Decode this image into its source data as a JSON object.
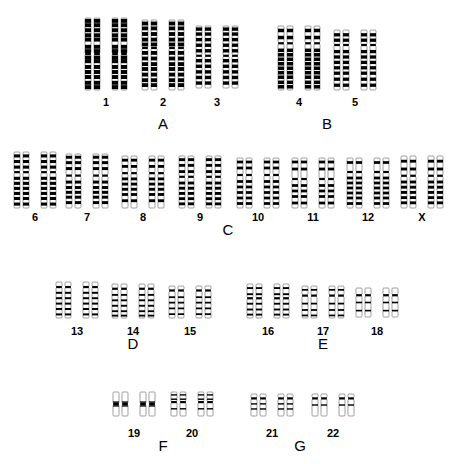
{
  "figure": {
    "kind": "human-karyotype",
    "background_color": "#ffffff",
    "ink_color": "#000000",
    "outline_color": "#777777",
    "total_chromosome_pairs": 23,
    "row_count": 5
  },
  "groups": [
    {
      "name": "A",
      "label": "A",
      "label_x": 163,
      "label_y": 115,
      "row": 1,
      "pairs": [
        "1",
        "2",
        "3"
      ]
    },
    {
      "name": "B",
      "label": "B",
      "label_x": 327,
      "label_y": 115,
      "row": 1,
      "pairs": [
        "4",
        "5"
      ]
    },
    {
      "name": "C",
      "label": "C",
      "label_x": 228,
      "label_y": 221,
      "row": 2,
      "pairs": [
        "6",
        "7",
        "8",
        "9",
        "10",
        "11",
        "12",
        "X"
      ]
    },
    {
      "name": "D",
      "label": "D",
      "label_x": 133,
      "label_y": 335,
      "row": 3,
      "pairs": [
        "13",
        "14",
        "15"
      ]
    },
    {
      "name": "E",
      "label": "E",
      "label_x": 323,
      "label_y": 335,
      "row": 3,
      "pairs": [
        "16",
        "17",
        "18"
      ]
    },
    {
      "name": "F",
      "label": "F",
      "label_x": 163,
      "label_y": 437,
      "row": 4,
      "pairs": [
        "19",
        "20"
      ]
    },
    {
      "name": "G",
      "label": "G",
      "label_x": 300,
      "label_y": 437,
      "row": 4,
      "pairs": [
        "21",
        "22"
      ]
    }
  ],
  "chromosomes": [
    {
      "label": "1",
      "group": "A",
      "cx": 106,
      "label_y": 96,
      "top": 18,
      "length": 72,
      "centromere_frac": 0.5,
      "width": 6,
      "gap": 3,
      "pair_gap": 12,
      "bands_p": [
        0.04,
        0.1,
        0.17,
        0.24,
        0.3,
        0.4,
        0.46
      ],
      "bands_q": [
        0.55,
        0.6,
        0.68,
        0.75,
        0.82,
        0.9,
        0.96
      ]
    },
    {
      "label": "2",
      "group": "A",
      "cx": 163,
      "label_y": 96,
      "top": 20,
      "length": 70,
      "centromere_frac": 0.4,
      "width": 6,
      "gap": 3,
      "pair_gap": 12,
      "bands_p": [
        0.05,
        0.12,
        0.2,
        0.28,
        0.35
      ],
      "bands_q": [
        0.47,
        0.55,
        0.63,
        0.7,
        0.78,
        0.86,
        0.93
      ]
    },
    {
      "label": "3",
      "group": "A",
      "cx": 217,
      "label_y": 96,
      "top": 26,
      "length": 62,
      "centromere_frac": 0.48,
      "width": 6,
      "gap": 3,
      "pair_gap": 12,
      "bands_p": [
        0.05,
        0.13,
        0.22,
        0.31,
        0.4
      ],
      "bands_q": [
        0.56,
        0.65,
        0.74,
        0.83,
        0.92
      ]
    },
    {
      "label": "4",
      "group": "B",
      "cx": 299,
      "label_y": 96,
      "top": 26,
      "length": 64,
      "centromere_frac": 0.27,
      "width": 6,
      "gap": 3,
      "pair_gap": 12,
      "bands_p": [
        0.07,
        0.18
      ],
      "bands_q": [
        0.38,
        0.45,
        0.52,
        0.59,
        0.66,
        0.73,
        0.8,
        0.88,
        0.95
      ]
    },
    {
      "label": "5",
      "group": "B",
      "cx": 355,
      "label_y": 96,
      "top": 30,
      "length": 60,
      "centromere_frac": 0.25,
      "width": 6,
      "gap": 3,
      "pair_gap": 12,
      "bands_p": [
        0.08,
        0.17
      ],
      "bands_q": [
        0.36,
        0.45,
        0.54,
        0.63,
        0.72,
        0.82,
        0.92
      ]
    },
    {
      "label": "6",
      "group": "C",
      "cx": 35,
      "label_y": 211,
      "top": 152,
      "length": 56,
      "centromere_frac": 0.36,
      "width": 6,
      "gap": 3,
      "pair_gap": 12,
      "bands_p": [
        0.07,
        0.17,
        0.27
      ],
      "bands_q": [
        0.47,
        0.56,
        0.65,
        0.74,
        0.83,
        0.93
      ]
    },
    {
      "label": "7",
      "group": "C",
      "cx": 87,
      "label_y": 211,
      "top": 154,
      "length": 54,
      "centromere_frac": 0.4,
      "width": 6,
      "gap": 3,
      "pair_gap": 12,
      "bands_p": [
        0.06,
        0.16,
        0.27
      ],
      "bands_q": [
        0.52,
        0.62,
        0.71,
        0.8,
        0.9
      ]
    },
    {
      "label": "8",
      "group": "C",
      "cx": 143,
      "label_y": 211,
      "top": 156,
      "length": 52,
      "centromere_frac": 0.33,
      "width": 6,
      "gap": 3,
      "pair_gap": 12,
      "bands_p": [
        0.08,
        0.2
      ],
      "bands_q": [
        0.44,
        0.54,
        0.64,
        0.74,
        0.86
      ]
    },
    {
      "label": "9",
      "group": "C",
      "cx": 200,
      "label_y": 211,
      "top": 156,
      "length": 52,
      "centromere_frac": 0.4,
      "width": 6,
      "gap": 3,
      "pair_gap": 12,
      "bands_p": [
        0.07,
        0.18,
        0.3
      ],
      "bands_q": [
        0.52,
        0.62,
        0.72,
        0.82,
        0.92
      ]
    },
    {
      "label": "10",
      "group": "C",
      "cx": 258,
      "label_y": 211,
      "top": 158,
      "length": 50,
      "centromere_frac": 0.34,
      "width": 6,
      "gap": 3,
      "pair_gap": 12,
      "bands_p": [
        0.08,
        0.2
      ],
      "bands_q": [
        0.47,
        0.58,
        0.69,
        0.8,
        0.91
      ]
    },
    {
      "label": "11",
      "group": "C",
      "cx": 313,
      "label_y": 211,
      "top": 158,
      "length": 50,
      "centromere_frac": 0.42,
      "width": 6,
      "gap": 3,
      "pair_gap": 12,
      "bands_p": [
        0.08,
        0.22
      ],
      "bands_q": [
        0.55,
        0.66,
        0.77,
        0.9
      ]
    },
    {
      "label": "12",
      "group": "C",
      "cx": 368,
      "label_y": 211,
      "top": 158,
      "length": 50,
      "centromere_frac": 0.28,
      "width": 6,
      "gap": 3,
      "pair_gap": 12,
      "bands_p": [
        0.09
      ],
      "bands_q": [
        0.4,
        0.5,
        0.6,
        0.7,
        0.8,
        0.91
      ]
    },
    {
      "label": "X",
      "group": "C",
      "cx": 422,
      "label_y": 211,
      "top": 156,
      "length": 52,
      "centromere_frac": 0.38,
      "width": 6,
      "gap": 3,
      "pair_gap": 12,
      "bands_p": [
        0.1,
        0.25
      ],
      "bands_q": [
        0.5,
        0.6,
        0.7,
        0.8,
        0.9
      ]
    },
    {
      "label": "13",
      "group": "D",
      "cx": 77,
      "label_y": 325,
      "top": 282,
      "length": 36,
      "centromere_frac": 0.14,
      "width": 6,
      "gap": 3,
      "pair_gap": 12,
      "bands_p": [],
      "bands_q": [
        0.3,
        0.45,
        0.6,
        0.75,
        0.9
      ]
    },
    {
      "label": "14",
      "group": "D",
      "cx": 133,
      "label_y": 325,
      "top": 284,
      "length": 34,
      "centromere_frac": 0.14,
      "width": 6,
      "gap": 3,
      "pair_gap": 12,
      "bands_p": [],
      "bands_q": [
        0.32,
        0.48,
        0.64,
        0.8,
        0.93
      ]
    },
    {
      "label": "15",
      "group": "D",
      "cx": 190,
      "label_y": 325,
      "top": 286,
      "length": 32,
      "centromere_frac": 0.14,
      "width": 6,
      "gap": 3,
      "pair_gap": 12,
      "bands_p": [],
      "bands_q": [
        0.35,
        0.52,
        0.7,
        0.88
      ]
    },
    {
      "label": "16",
      "group": "E",
      "cx": 268,
      "label_y": 325,
      "top": 284,
      "length": 34,
      "centromere_frac": 0.42,
      "width": 6,
      "gap": 3,
      "pair_gap": 12,
      "bands_p": [
        0.12,
        0.3
      ],
      "bands_q": [
        0.58,
        0.75,
        0.9
      ]
    },
    {
      "label": "17",
      "group": "E",
      "cx": 323,
      "label_y": 325,
      "top": 286,
      "length": 32,
      "centromere_frac": 0.3,
      "width": 6,
      "gap": 3,
      "pair_gap": 12,
      "bands_p": [
        0.12
      ],
      "bands_q": [
        0.55,
        0.75,
        0.92
      ]
    },
    {
      "label": "18",
      "group": "E",
      "cx": 377,
      "label_y": 325,
      "top": 288,
      "length": 29,
      "centromere_frac": 0.25,
      "width": 6,
      "gap": 3,
      "pair_gap": 12,
      "bands_p": [],
      "bands_q": [
        0.5,
        0.78
      ]
    },
    {
      "label": "19",
      "group": "F",
      "cx": 134,
      "label_y": 427,
      "top": 392,
      "length": 24,
      "centromere_frac": 0.5,
      "width": 6,
      "gap": 3,
      "pair_gap": 12,
      "bands_p": [
        0.42
      ],
      "bands_q": [
        0.58
      ]
    },
    {
      "label": "20",
      "group": "F",
      "cx": 192,
      "label_y": 427,
      "top": 392,
      "length": 24,
      "centromere_frac": 0.42,
      "width": 6,
      "gap": 3,
      "pair_gap": 12,
      "bands_p": [
        0.12,
        0.3
      ],
      "bands_q": [
        0.7
      ]
    },
    {
      "label": "21",
      "group": "G",
      "cx": 272,
      "label_y": 427,
      "top": 394,
      "length": 22,
      "centromere_frac": 0.2,
      "width": 6,
      "gap": 3,
      "pair_gap": 12,
      "bands_p": [],
      "bands_q": [
        0.45,
        0.68
      ]
    },
    {
      "label": "22",
      "group": "G",
      "cx": 333,
      "label_y": 427,
      "top": 394,
      "length": 22,
      "centromere_frac": 0.2,
      "width": 6,
      "gap": 3,
      "pair_gap": 12,
      "bands_p": [],
      "bands_q": [
        0.5
      ]
    }
  ]
}
